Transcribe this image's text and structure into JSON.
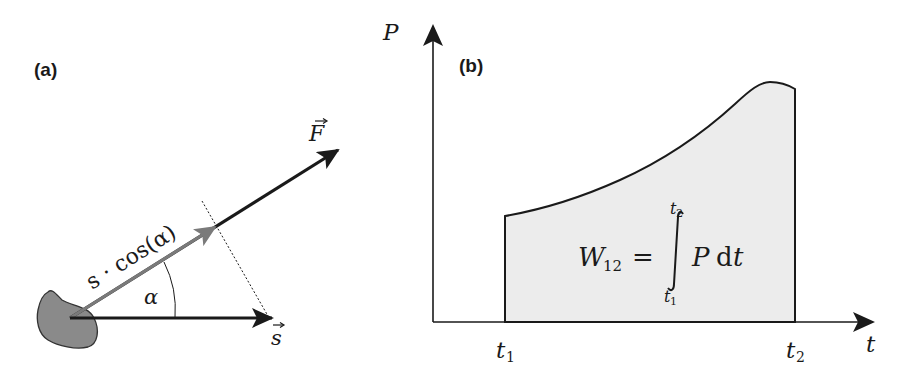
{
  "panel_a": {
    "label": "(a)",
    "force_label": "F",
    "displacement_label": "s",
    "projection_label": "s · cos(α)",
    "angle_label": "α",
    "colors": {
      "force_arrow": "#1a1a1a",
      "projection_arrow": "#7a7a7a",
      "displacement_arrow": "#1a1a1a",
      "body_fill": "#8a8a8a"
    }
  },
  "panel_b": {
    "label": "(b)",
    "y_axis_label": "P",
    "x_axis_label": "t",
    "t1_label": "t",
    "t1_sub": "1",
    "t2_label": "t",
    "t2_sub": "2",
    "formula": {
      "lhs": "W",
      "lhs_sub": "12",
      "equals": "=",
      "integral": "∫",
      "upper_limit": "t",
      "upper_sub": "2",
      "lower_limit": "t",
      "lower_sub": "1",
      "integrand": "P",
      "differential": "d",
      "variable": "t"
    },
    "colors": {
      "area_fill": "#ececec",
      "curve": "#1a1a1a"
    }
  }
}
